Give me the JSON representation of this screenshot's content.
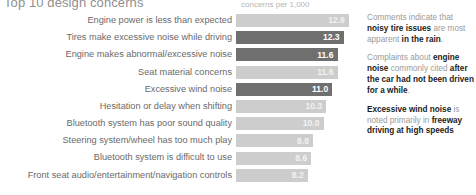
{
  "header": {
    "title": "Top 10 design concerns",
    "axis_caption": "concerns per 1,000"
  },
  "chart_data": {
    "type": "bar",
    "orientation": "horizontal",
    "title": "Top 10 design concerns",
    "xlabel": "concerns per 1,000",
    "ylabel": "",
    "xlim": [
      0,
      13.6
    ],
    "grid": false,
    "legend": "none",
    "categories": [
      "Engine power is less than expected",
      "Tires make excessive noise while driving",
      "Engine makes abnormal/excessive noise",
      "Seat material concerns",
      "Excessive wind noise",
      "Hesitation or delay when shifting",
      "Bluetooth system has poor sound quality",
      "Steering system/wheel has too much play",
      "Bluetooth system is difficult to use",
      "Front seat audio/entertainment/navigation controls"
    ],
    "values": [
      12.9,
      12.3,
      11.6,
      11.6,
      11.0,
      10.3,
      10.0,
      8.8,
      8.6,
      8.2
    ],
    "value_labels": [
      "12.9",
      "12.3",
      "11.6",
      "11.6",
      "11.0",
      "10.3",
      "10.0",
      "8.8",
      "8.6",
      "8.2"
    ],
    "bar_styles": [
      "light",
      "dark",
      "dark",
      "light",
      "dark",
      "light",
      "light",
      "light",
      "light",
      "light"
    ],
    "colors": {
      "bar_light": "#cdcdcd",
      "bar_dark": "#6f6f6f",
      "label_text": "#6a6a6a",
      "caption_text": "#b5b5b5",
      "note_text": "#9a9a9a",
      "note_emphasis": "#1c1c1c"
    }
  },
  "notes": [
    {
      "parts": [
        {
          "text": "Comments indicate that ",
          "bold": false
        },
        {
          "text": "noisy tire issues",
          "bold": true
        },
        {
          "text": " are most apparent ",
          "bold": false
        },
        {
          "text": "in the rain",
          "bold": true
        },
        {
          "text": ".",
          "bold": false
        }
      ]
    },
    {
      "parts": [
        {
          "text": "Complaints about ",
          "bold": false
        },
        {
          "text": "engine noise",
          "bold": true
        },
        {
          "text": " commonly cited ",
          "bold": false
        },
        {
          "text": "after the car had not been driven for a while",
          "bold": true
        },
        {
          "text": ".",
          "bold": false
        }
      ]
    },
    {
      "parts": [
        {
          "text": "Excessive wind noise",
          "bold": true
        },
        {
          "text": " is noted primarily in ",
          "bold": false
        },
        {
          "text": "freeway driving at high speeds",
          "bold": true
        }
      ]
    }
  ]
}
